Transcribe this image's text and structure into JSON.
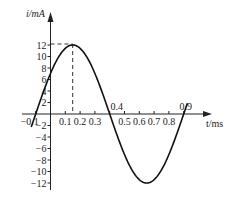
{
  "chart_data": {
    "type": "line",
    "title": "",
    "xlabel": "t/ms",
    "ylabel": "i/mA",
    "xlim": [
      -0.1,
      0.9
    ],
    "ylim": [
      -12,
      12
    ],
    "x_ticks": [
      "-0.1",
      "0.1",
      "0.2",
      "0.3",
      "0.4",
      "0.5",
      "0.6",
      "0.7",
      "0.8",
      "0.9"
    ],
    "y_ticks": [
      "12",
      "10",
      "8",
      "6",
      "4",
      "2",
      "-2",
      "-4",
      "-6",
      "-8",
      "-10",
      "-12"
    ],
    "grid": false,
    "legend": null,
    "annotations": [
      "dashed guide lines from peak (0.15, 12) to both axes"
    ],
    "series": [
      {
        "name": "i(t)",
        "description": "sinusoid, amplitude 12 mA, period 1.0 ms, zero crossings at -0.1, 0.4, 0.9 ms",
        "x": [
          -0.1,
          0.0,
          0.05,
          0.1,
          0.15,
          0.2,
          0.25,
          0.3,
          0.4,
          0.5,
          0.6,
          0.65,
          0.7,
          0.8,
          0.9
        ],
        "values": [
          0,
          7.05,
          9.71,
          11.41,
          12,
          11.41,
          9.71,
          7.05,
          0,
          -7.05,
          -11.41,
          -12,
          -11.41,
          -7.05,
          0
        ]
      }
    ]
  }
}
